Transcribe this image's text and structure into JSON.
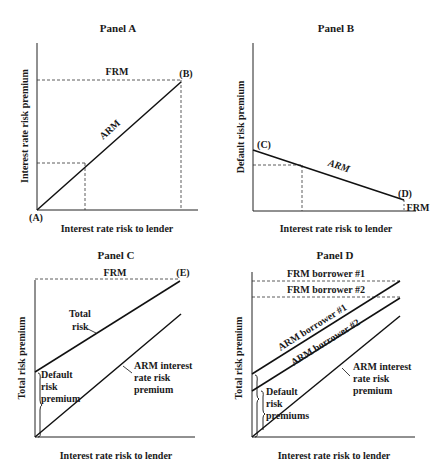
{
  "panels": {
    "a": {
      "title": "Panel A",
      "ylabel": "Interest rate risk premium",
      "xlabel": "Interest rate risk to lender",
      "frm_label": "FRM",
      "arm_label": "ARM",
      "point_start": "(A)",
      "point_end": "(B)"
    },
    "b": {
      "title": "Panel B",
      "ylabel": "Default risk premium",
      "xlabel": "Interest rate risk to lender",
      "arm_label": "ARM",
      "frm_label": "FRM",
      "point_start": "(C)",
      "point_end": "(D)"
    },
    "c": {
      "title": "Panel C",
      "ylabel": "Total risk premium",
      "xlabel": "Interest rate risk to lender",
      "frm_label": "FRM",
      "point_end": "(E)",
      "total_risk_1": "Total",
      "total_risk_2": "risk",
      "default_1": "Default",
      "default_2": "risk",
      "default_3": "premium",
      "arm_1": "ARM interest",
      "arm_2": "rate risk",
      "arm_3": "premium"
    },
    "d": {
      "title": "Panel D",
      "ylabel": "Total risk premium",
      "xlabel": "Interest rate risk to lender",
      "frm1_label": "FRM borrower #1",
      "frm2_label": "FRM borrower #2",
      "arm1_label": "ARM borrower #1",
      "arm2_label": "ARM borrower #2",
      "default_1": "Default",
      "default_2": "risk",
      "default_3": "premiums",
      "arm_1": "ARM interest",
      "arm_2": "rate risk",
      "arm_3": "premium"
    }
  }
}
